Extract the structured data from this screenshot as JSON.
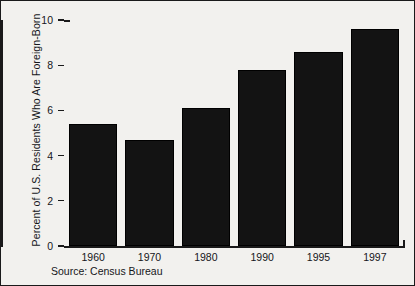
{
  "chart_data": {
    "type": "bar",
    "title": "",
    "subtitle": "",
    "xlabel": "",
    "ylabel": "Percent of U.S. Residents Who Are Foreign-Born",
    "categories": [
      "1960",
      "1970",
      "1980",
      "1990",
      "1995",
      "1997"
    ],
    "values": [
      5.4,
      4.7,
      6.1,
      7.8,
      8.6,
      9.6
    ],
    "ylim": [
      0,
      10
    ],
    "yticks": [
      0,
      2,
      4,
      6,
      8,
      10
    ],
    "ytick_labels": [
      "0",
      "2",
      "4",
      "6",
      "8",
      "10"
    ],
    "grid": false,
    "legend": "none",
    "bar_color": "#131313",
    "background_color": "#f2f1ee",
    "axis_color": "#1a1a1a",
    "annotations": [
      "Source: Census Bureau"
    ]
  },
  "figure": {
    "source_note": "Source: Census Bureau"
  }
}
